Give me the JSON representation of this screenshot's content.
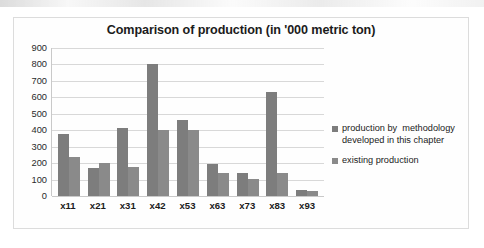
{
  "chart_data": {
    "type": "bar",
    "title": "Comparison of production (in '000 metric ton)",
    "xlabel": "",
    "ylabel": "",
    "ylim": [
      0,
      900
    ],
    "yticks": [
      900,
      800,
      700,
      600,
      500,
      400,
      300,
      200,
      100,
      0
    ],
    "grid": true,
    "legend_position": "right",
    "categories": [
      "x11",
      "x21",
      "x31",
      "x42",
      "x53",
      "x63",
      "x73",
      "x83",
      "x93"
    ],
    "series": [
      {
        "name": "production by  methodology developed in this chapter",
        "color": "#7d7d7d",
        "values": [
          380,
          170,
          415,
          805,
          460,
          195,
          140,
          630,
          35
        ]
      },
      {
        "name": "existing production",
        "color": "#8a8a8a",
        "values": [
          235,
          200,
          175,
          400,
          400,
          140,
          105,
          140,
          30
        ]
      }
    ]
  },
  "legend": {
    "items": [
      {
        "label": "production by  methodology\ndeveloped in this chapter",
        "swatch": "#7d7d7d"
      },
      {
        "label": "existing production",
        "swatch": "#8a8a8a"
      }
    ]
  }
}
